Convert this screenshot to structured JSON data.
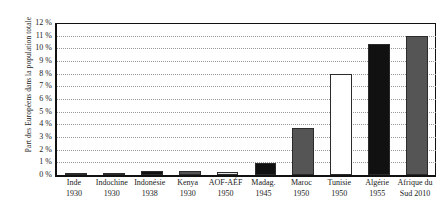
{
  "chart_data": {
    "type": "bar",
    "title": "",
    "xlabel": "",
    "ylabel": "Part des Européens dans la population totale",
    "ylim": [
      0,
      12
    ],
    "ytick_suffix": " %",
    "yticks": [
      0,
      1,
      2,
      3,
      4,
      5,
      6,
      7,
      8,
      9,
      10,
      11,
      12
    ],
    "ytick_labels": [
      "0 %",
      "1 %",
      "2 %",
      "3 %",
      "4 %",
      "5 %",
      "6 %",
      "7 %",
      "8 %",
      "9 %",
      "10 %",
      "11 %",
      "12 %"
    ],
    "grid": true,
    "grid_style": "dotted",
    "legend": "none",
    "categories": [
      {
        "name": "Inde",
        "year": "1930",
        "value": 0.06,
        "color": "#111111"
      },
      {
        "name": "Indochine",
        "year": "1930",
        "value": 0.18,
        "color": "#4a4a4a"
      },
      {
        "name": "Indonésie",
        "year": "1938",
        "value": 0.33,
        "color": "#111111"
      },
      {
        "name": "Kenya",
        "year": "1930",
        "value": 0.3,
        "color": "#555555"
      },
      {
        "name": "AOF-AÉF",
        "year": "1950",
        "value": 0.24,
        "color": "#e3e3e3"
      },
      {
        "name": "Madag.",
        "year": "1945",
        "value": 0.95,
        "color": "#111111"
      },
      {
        "name": "Maroc",
        "year": "1950",
        "value": 3.7,
        "color": "#555555"
      },
      {
        "name": "Tunisie",
        "year": "1950",
        "value": 8.0,
        "color": "#ffffff"
      },
      {
        "name": "Algérie",
        "year": "1955",
        "value": 10.35,
        "color": "#111111"
      },
      {
        "name": "Afrique du",
        "year": "Sud 2010",
        "value": 11.0,
        "color": "#555555"
      }
    ],
    "values": [
      0.06,
      0.18,
      0.33,
      0.3,
      0.24,
      0.95,
      3.7,
      8.0,
      10.35,
      11.0
    ],
    "category_labels": [
      "Inde 1930",
      "Indochine 1930",
      "Indonésie 1938",
      "Kenya 1930",
      "AOF-AÉF 1950",
      "Madag. 1945",
      "Maroc 1950",
      "Tunisie 1950",
      "Algérie 1955",
      "Afrique du Sud 2010"
    ]
  },
  "axis": {
    "y_title": "Part des Européens dans la population totale"
  },
  "colors": {
    "axis": "#111111",
    "grid": "#9a9a9a",
    "background": "#ffffff",
    "bar_outline": "#2b2b2b"
  }
}
